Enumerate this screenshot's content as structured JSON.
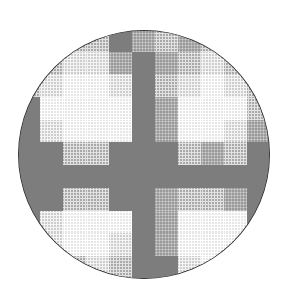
{
  "image": {
    "description": "Circular halftone grayscale pattern with a dark cross dividing four light blob-shaped regions",
    "grid": {
      "rows": 11,
      "cols": 11,
      "levels": {
        "D": "#7d7d7d",
        "m": "#9a9a9a",
        "M": "#a9a9a9",
        "L": "#cdcdcd",
        "W": "#e6e6e6"
      },
      "cells": [
        "MMMMDmMmMMM",
        "MMLLmDmMLMM",
        "MLWWLDMLWLM",
        "DWWWWDmWWWM",
        "DLWWWDmWWLm",
        "DDMMDDDMmMD",
        "DDDDDDDDDDD",
        "DDMMDDmMMmD",
        "DLWWWDmWWWD",
        "DLWWLDmWWWD",
        "DMMLMDDLWLD"
      ]
    }
  }
}
